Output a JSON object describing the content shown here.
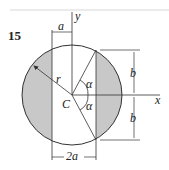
{
  "problem_number": "15",
  "labels": {
    "y_axis": "y",
    "x_axis": "x",
    "center": "C",
    "radius": "r",
    "offset_a": "a",
    "width_2a": "2a",
    "angle_upper": "α",
    "angle_lower": "α",
    "half_height_upper": "b",
    "half_height_lower": "b"
  },
  "colors": {
    "shade": "#c8c8c8",
    "line": "#333333",
    "top_rule": "#e4e4e4"
  }
}
